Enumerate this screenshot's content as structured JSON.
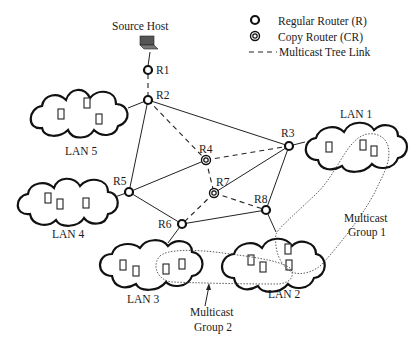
{
  "legend": {
    "regular_router": "Regular Router (R)",
    "copy_router": "Copy Router (CR)",
    "tree_link": "Multicast Tree Link"
  },
  "source": {
    "label": "Source Host",
    "icon": "laptop-icon"
  },
  "routers": [
    {
      "id": "R1",
      "label": "R1",
      "type": "regular"
    },
    {
      "id": "R2",
      "label": "R2",
      "type": "regular"
    },
    {
      "id": "R3",
      "label": "R3",
      "type": "regular"
    },
    {
      "id": "R4",
      "label": "R4",
      "type": "copy"
    },
    {
      "id": "R5",
      "label": "R5",
      "type": "regular"
    },
    {
      "id": "R6",
      "label": "R6",
      "type": "regular"
    },
    {
      "id": "R7",
      "label": "R7",
      "type": "copy"
    },
    {
      "id": "R8",
      "label": "R8",
      "type": "regular"
    }
  ],
  "lans": [
    {
      "id": "LAN1",
      "label": "LAN 1",
      "hosts": 3
    },
    {
      "id": "LAN2",
      "label": "LAN 2",
      "hosts": 5
    },
    {
      "id": "LAN3",
      "label": "LAN 3",
      "hosts": 4
    },
    {
      "id": "LAN4",
      "label": "LAN 4",
      "hosts": 3
    },
    {
      "id": "LAN5",
      "label": "LAN 5",
      "hosts": 3
    }
  ],
  "groups": {
    "group1": [
      "Multicast",
      "Group 1"
    ],
    "group2": [
      "Multicast",
      "Group 2"
    ]
  },
  "links": {
    "tree": [
      [
        "Host",
        "R1"
      ],
      [
        "R1",
        "R2"
      ],
      [
        "R2",
        "R4"
      ],
      [
        "R4",
        "R3"
      ],
      [
        "R4",
        "R7"
      ],
      [
        "R7",
        "R6"
      ],
      [
        "R7",
        "R8"
      ]
    ],
    "regular": [
      [
        "R2",
        "R3"
      ],
      [
        "R2",
        "R5"
      ],
      [
        "R5",
        "R4"
      ],
      [
        "R5",
        "R6"
      ],
      [
        "R6",
        "R8"
      ],
      [
        "R7",
        "R3"
      ],
      [
        "R3",
        "R8"
      ],
      [
        "R2",
        "LAN5"
      ],
      [
        "R5",
        "LAN4"
      ],
      [
        "R3",
        "LAN1"
      ],
      [
        "R6",
        "LAN3"
      ],
      [
        "R8",
        "LAN2"
      ]
    ]
  }
}
